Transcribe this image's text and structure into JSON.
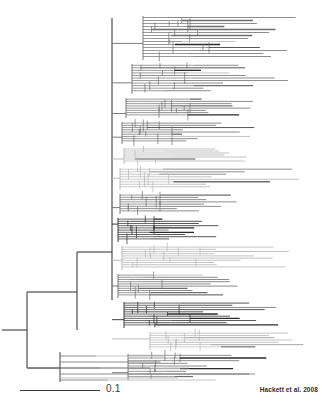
{
  "figure": {
    "width": 322,
    "height": 404,
    "background_color": "#ffffff"
  },
  "scale_bar": {
    "label": "0.1",
    "value": 0.1,
    "unit": "substitutions per site",
    "x_start": 20,
    "x_end": 100,
    "y": 390,
    "color": "#3a3a3a"
  },
  "citation": {
    "text": "Hackett et al. 2008",
    "x_right": 318,
    "y": 391,
    "color": "#2e2e2e"
  },
  "chart_data": {
    "type": "tree",
    "layout": "rectangular-cladogram",
    "orientation": "left-to-right",
    "tip_count": 181,
    "root_x": 2,
    "root_y": 330,
    "scale_bar_value": 0.1,
    "scale_bar_pixels": 80,
    "line_color_dark": "#2b2b2b",
    "line_color_mid": "#6e6e6e",
    "line_color_light": "#b4b4b4",
    "x_axis_range": [
      0,
      305
    ],
    "y_axis_range": [
      0,
      382
    ],
    "backbone": [
      {
        "name": "root-stub",
        "x1": 2,
        "y1": 330,
        "x2": 27,
        "y2": 330,
        "shade": "dark"
      },
      {
        "name": "root-vertical",
        "x1": 27,
        "y1": 292,
        "x2": 27,
        "y2": 368,
        "shade": "dark"
      },
      {
        "name": "node-a-horizontal",
        "x1": 27,
        "y1": 292,
        "x2": 77,
        "y2": 292,
        "shade": "dark"
      },
      {
        "name": "node-a-vertical",
        "x1": 77,
        "y1": 252,
        "x2": 77,
        "y2": 330,
        "shade": "dark"
      },
      {
        "name": "node-b-horizontal",
        "x1": 77,
        "y1": 252,
        "x2": 112,
        "y2": 252,
        "shade": "dark"
      },
      {
        "name": "trunk-vertical",
        "x1": 112,
        "y1": 18,
        "x2": 112,
        "y2": 300,
        "shade": "dark"
      },
      {
        "name": "lower-clade-horizontal",
        "x1": 27,
        "y1": 368,
        "x2": 60,
        "y2": 368,
        "shade": "dark"
      }
    ]
  }
}
